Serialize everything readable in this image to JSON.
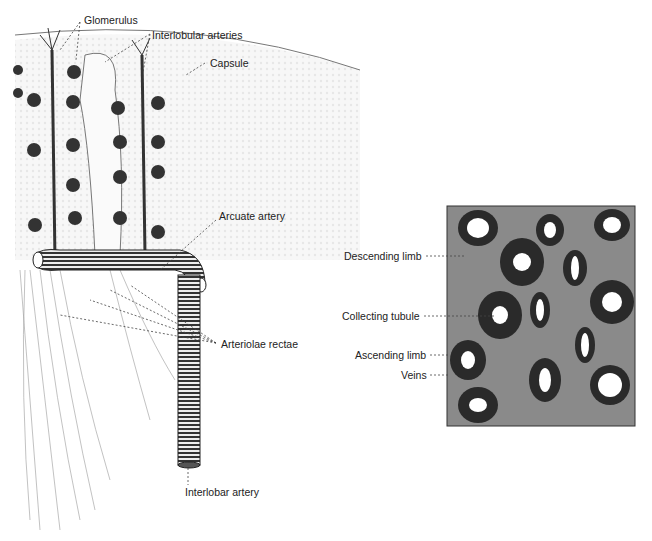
{
  "left_figure": {
    "labels": {
      "glomerulus": "Glomerulus",
      "interlobular_arteries": "Interlobular arteries",
      "capsule": "Capsule",
      "arcuate_artery": "Arcuate artery",
      "arteriolae_rectae": "Arteriolae rectae",
      "interlobar_artery": "Interlobar artery"
    }
  },
  "right_figure": {
    "labels": {
      "descending_limb": "Descending limb",
      "collecting_tubule": "Collecting tubule",
      "ascending_limb": "Ascending limb",
      "veins": "Veins"
    }
  }
}
